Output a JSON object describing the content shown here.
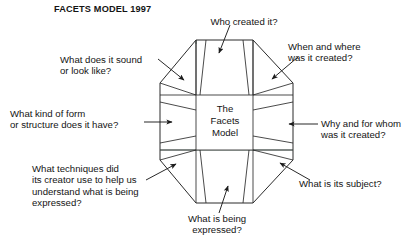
{
  "title": "FACETS MODEL 1997",
  "center": {
    "line1": "The",
    "line2": "Facets",
    "line3": "Model"
  },
  "colors": {
    "background": "#ffffff",
    "stroke": "#2a2a2a",
    "text": "#141414",
    "accent_edge": "#5f7a6e"
  },
  "diagram": {
    "type": "octagon-facets",
    "facet_count": 8,
    "center_shape": "rectangle"
  },
  "labels": [
    {
      "id": "sound",
      "name": "label-what-does-it-sound-or-look-like",
      "text": "What does it sound\nor look like?",
      "position": "upper-left",
      "arrow": "points-down-right-into-upper-left-facet"
    },
    {
      "id": "who",
      "name": "label-who-created-it",
      "text": "Who created it?",
      "position": "top",
      "arrow": "points-down-into-top-facet"
    },
    {
      "id": "when",
      "name": "label-when-and-where-was-it-created",
      "text": "When and where\nwas it created?",
      "position": "upper-right",
      "arrow": "points-down-left-into-upper-right-facet"
    },
    {
      "id": "form",
      "name": "label-what-kind-of-form-or-structure",
      "text": "What kind of form\nor structure does it have?",
      "position": "left",
      "arrow": "points-right-into-left-facet"
    },
    {
      "id": "why",
      "name": "label-why-and-for-whom-was-it-created",
      "text": "Why and for whom\nwas it created?",
      "position": "right",
      "arrow": "points-left-into-right-facet"
    },
    {
      "id": "techniques",
      "name": "label-what-techniques-did-its-creator-use",
      "text": "What techniques did\nits creator use to help us\nunderstand what is being\nexpressed?",
      "position": "lower-left",
      "arrow": "points-up-right-into-lower-left-facet"
    },
    {
      "id": "subject",
      "name": "label-what-is-its-subject",
      "text": "What is its subject?",
      "position": "lower-right",
      "arrow": "points-up-left-into-lower-right-facet"
    },
    {
      "id": "expressed",
      "name": "label-what-is-being-expressed",
      "text": "What is being\nexpressed?",
      "position": "bottom",
      "arrow": "points-up-into-bottom-facet"
    }
  ]
}
